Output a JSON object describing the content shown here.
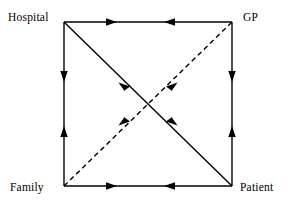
{
  "diagram": {
    "type": "node-link-graph",
    "shape": "square-with-diagonals",
    "background_color": "#ffffff",
    "stroke_color": "#000000",
    "nodes": [
      {
        "id": "hospital",
        "label": "Hospital",
        "corner": "top-left",
        "x": 64,
        "y": 22
      },
      {
        "id": "gp",
        "label": "GP",
        "corner": "top-right",
        "x": 232,
        "y": 22
      },
      {
        "id": "family",
        "label": "Family",
        "corner": "bottom-left",
        "x": 64,
        "y": 186
      },
      {
        "id": "patient",
        "label": "Patient",
        "corner": "bottom-right",
        "x": 232,
        "y": 186
      }
    ],
    "edges": [
      {
        "id": "edge-hospital-gp",
        "from": "hospital",
        "to": "gp",
        "style": "solid",
        "arrows": "both",
        "position": "top"
      },
      {
        "id": "edge-family-patient",
        "from": "family",
        "to": "patient",
        "style": "solid",
        "arrows": "both",
        "position": "bottom"
      },
      {
        "id": "edge-hospital-family",
        "from": "hospital",
        "to": "family",
        "style": "solid",
        "arrows": "both",
        "position": "left"
      },
      {
        "id": "edge-gp-patient",
        "from": "gp",
        "to": "patient",
        "style": "solid",
        "arrows": "both",
        "position": "right"
      },
      {
        "id": "edge-hospital-patient",
        "from": "hospital",
        "to": "patient",
        "style": "solid",
        "arrows": "both",
        "position": "diagonal-nw-se"
      },
      {
        "id": "edge-family-gp",
        "from": "family",
        "to": "gp",
        "style": "dashed",
        "arrows": "to-gp",
        "position": "diagonal-sw-ne"
      }
    ]
  }
}
